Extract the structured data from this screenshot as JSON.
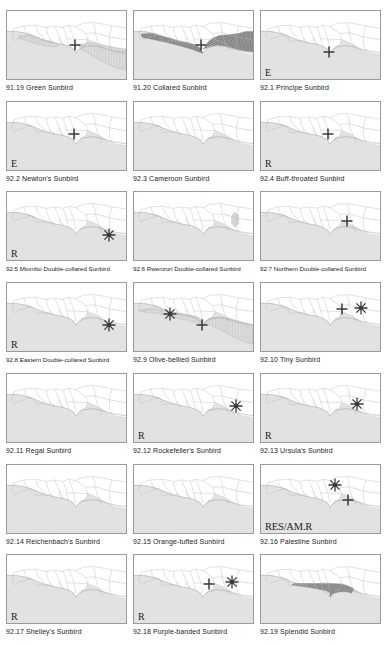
{
  "figure": {
    "type": "map-plate-grid",
    "columns": 3,
    "rows": 7,
    "region": "West and Central Africa",
    "legend_symbols": {
      "cross": "cross-marker",
      "star": "starburst-marker"
    }
  },
  "cells": [
    {
      "id": "91.19",
      "caption": "91.19 Green Sunbird",
      "status": "",
      "range_style": "light-gray-stipple",
      "range_paths": [
        "west-coast-patch",
        "central-congo-patch"
      ],
      "markers": [
        {
          "type": "cross",
          "x": 57,
          "y": 50
        }
      ]
    },
    {
      "id": "91.20",
      "caption": "91.20 Collared Sunbird",
      "status": "",
      "range_style": "dark-crosshatch",
      "range_paths": [
        "guinea-coast-band",
        "congo-basin-block"
      ],
      "markers": [
        {
          "type": "cross",
          "x": 56,
          "y": 50
        }
      ]
    },
    {
      "id": "92.1",
      "caption": "92.1 Principe Sunbird",
      "status": "E",
      "range_style": "none",
      "range_paths": [],
      "markers": [
        {
          "type": "cross",
          "x": 57,
          "y": 60
        }
      ]
    },
    {
      "id": "92.2",
      "caption": "92.2 Newton's Sunbird",
      "status": "E",
      "range_style": "none",
      "range_paths": [],
      "markers": [
        {
          "type": "cross",
          "x": 56,
          "y": 47
        }
      ]
    },
    {
      "id": "92.3",
      "caption": "92.3 Cameroon Sunbird",
      "status": "",
      "range_style": "none",
      "range_paths": [],
      "markers": []
    },
    {
      "id": "92.4",
      "caption": "92.4 Buff-throated Sunbird",
      "status": "R",
      "range_style": "none",
      "range_paths": [],
      "markers": [
        {
          "type": "cross",
          "x": 56,
          "y": 48
        }
      ]
    },
    {
      "id": "92.5",
      "caption": "92.5 Miombo Double-collared Sunbird",
      "status": "R",
      "range_style": "none",
      "range_paths": [],
      "markers": [
        {
          "type": "star",
          "x": 86,
          "y": 62
        }
      ]
    },
    {
      "id": "92.6",
      "caption": "92.6 Rwenzori Double-collared Sunbird",
      "status": "",
      "range_style": "faint-edge",
      "range_paths": [
        "east-edge-sliver"
      ],
      "markers": []
    },
    {
      "id": "92.7",
      "caption": "92.7 Northern Double-collared Sunbird",
      "status": "",
      "range_style": "none",
      "range_paths": [],
      "markers": [
        {
          "type": "cross",
          "x": 72,
          "y": 42
        }
      ]
    },
    {
      "id": "92.8",
      "caption": "92.8 Eastern Double-collared Sunbird",
      "status": "R",
      "range_style": "none",
      "range_paths": [],
      "markers": [
        {
          "type": "star",
          "x": 86,
          "y": 62
        }
      ]
    },
    {
      "id": "92.9",
      "caption": "92.9 Olive-bellied Sunbird",
      "status": "",
      "range_style": "light-gray-stipple",
      "range_paths": [
        "sahel-coast-band",
        "congo-block"
      ],
      "markers": [
        {
          "type": "star",
          "x": 30,
          "y": 45
        },
        {
          "type": "cross",
          "x": 57,
          "y": 62
        }
      ]
    },
    {
      "id": "92.10",
      "caption": "92.10 Tiny Sunbird",
      "status": "",
      "range_style": "none",
      "range_paths": [],
      "markers": [
        {
          "type": "cross",
          "x": 68,
          "y": 38
        },
        {
          "type": "star",
          "x": 84,
          "y": 36
        }
      ]
    },
    {
      "id": "92.11",
      "caption": "92.11 Regal Sunbird",
      "status": "",
      "range_style": "none",
      "range_paths": [],
      "markers": []
    },
    {
      "id": "92.12",
      "caption": "92.12 Rockefeller's Sunbird",
      "status": "R",
      "range_style": "none",
      "range_paths": [],
      "markers": [
        {
          "type": "star",
          "x": 86,
          "y": 48
        }
      ]
    },
    {
      "id": "92.13",
      "caption": "92.13 Ursula's Sunbird",
      "status": "R",
      "range_style": "none",
      "range_paths": [],
      "markers": [
        {
          "type": "star",
          "x": 81,
          "y": 44
        }
      ]
    },
    {
      "id": "92.14",
      "caption": "92.14 Reichenbach's Sunbird",
      "status": "",
      "range_style": "none",
      "range_paths": [],
      "markers": []
    },
    {
      "id": "92.15",
      "caption": "92.15 Orange-tufted Sunbird",
      "status": "",
      "range_style": "none",
      "range_paths": [],
      "markers": []
    },
    {
      "id": "92.16",
      "caption": "92.16 Palestine Sunbird",
      "status": "RES/AM.R",
      "range_style": "none",
      "range_paths": [],
      "markers": [
        {
          "type": "star",
          "x": 62,
          "y": 30
        },
        {
          "type": "cross",
          "x": 73,
          "y": 52
        }
      ]
    },
    {
      "id": "92.17",
      "caption": "92.17 Shelley's Sunbird",
      "status": "R",
      "range_style": "none",
      "range_paths": [],
      "markers": []
    },
    {
      "id": "92.18",
      "caption": "92.18 Purple-banded Sunbird",
      "status": "R",
      "range_style": "none",
      "range_paths": [],
      "markers": [
        {
          "type": "cross",
          "x": 63,
          "y": 42
        },
        {
          "type": "star",
          "x": 82,
          "y": 40
        }
      ]
    },
    {
      "id": "92.19",
      "caption": "92.19 Splendid Sunbird",
      "status": "",
      "range_style": "dark-crosshatch",
      "range_paths": [
        "guinea-nigeria-band"
      ],
      "markers": []
    }
  ]
}
